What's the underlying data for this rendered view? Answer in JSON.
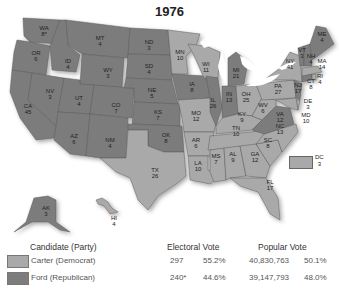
{
  "title": "1976",
  "colors": {
    "democrat": "#a9a9a9",
    "republican": "#7c7c7c",
    "border": "#5a5a5a",
    "water": "#ffffff"
  },
  "states": [
    {
      "abbr": "WA",
      "ev": "8*",
      "party": "R"
    },
    {
      "abbr": "OR",
      "ev": "6",
      "party": "R"
    },
    {
      "abbr": "CA",
      "ev": "45",
      "party": "R"
    },
    {
      "abbr": "ID",
      "ev": "4",
      "party": "R"
    },
    {
      "abbr": "NV",
      "ev": "3",
      "party": "R"
    },
    {
      "abbr": "MT",
      "ev": "4",
      "party": "R"
    },
    {
      "abbr": "WY",
      "ev": "3",
      "party": "R"
    },
    {
      "abbr": "UT",
      "ev": "4",
      "party": "R"
    },
    {
      "abbr": "AZ",
      "ev": "6",
      "party": "R"
    },
    {
      "abbr": "CO",
      "ev": "7",
      "party": "R"
    },
    {
      "abbr": "NM",
      "ev": "4",
      "party": "R"
    },
    {
      "abbr": "ND",
      "ev": "3",
      "party": "R"
    },
    {
      "abbr": "SD",
      "ev": "4",
      "party": "R"
    },
    {
      "abbr": "NE",
      "ev": "5",
      "party": "R"
    },
    {
      "abbr": "KS",
      "ev": "7",
      "party": "R"
    },
    {
      "abbr": "OK",
      "ev": "8",
      "party": "R"
    },
    {
      "abbr": "TX",
      "ev": "26",
      "party": "D"
    },
    {
      "abbr": "MN",
      "ev": "10",
      "party": "D"
    },
    {
      "abbr": "IA",
      "ev": "8",
      "party": "R"
    },
    {
      "abbr": "MO",
      "ev": "12",
      "party": "D"
    },
    {
      "abbr": "AR",
      "ev": "6",
      "party": "D"
    },
    {
      "abbr": "LA",
      "ev": "10",
      "party": "D"
    },
    {
      "abbr": "WI",
      "ev": "11",
      "party": "D"
    },
    {
      "abbr": "IL",
      "ev": "26",
      "party": "R"
    },
    {
      "abbr": "MI",
      "ev": "21",
      "party": "R"
    },
    {
      "abbr": "IN",
      "ev": "13",
      "party": "R"
    },
    {
      "abbr": "OH",
      "ev": "25",
      "party": "D"
    },
    {
      "abbr": "KY",
      "ev": "9",
      "party": "D"
    },
    {
      "abbr": "TN",
      "ev": "10",
      "party": "D"
    },
    {
      "abbr": "MS",
      "ev": "7",
      "party": "D"
    },
    {
      "abbr": "AL",
      "ev": "9",
      "party": "D"
    },
    {
      "abbr": "GA",
      "ev": "12",
      "party": "D"
    },
    {
      "abbr": "FL",
      "ev": "17",
      "party": "D"
    },
    {
      "abbr": "SC",
      "ev": "8",
      "party": "D"
    },
    {
      "abbr": "NC",
      "ev": "13",
      "party": "D"
    },
    {
      "abbr": "VA",
      "ev": "12",
      "party": "R"
    },
    {
      "abbr": "WV",
      "ev": "6",
      "party": "D"
    },
    {
      "abbr": "PA",
      "ev": "27",
      "party": "D"
    },
    {
      "abbr": "NY",
      "ev": "41",
      "party": "D"
    },
    {
      "abbr": "NJ",
      "ev": "17",
      "party": "R"
    },
    {
      "abbr": "DE",
      "ev": "3",
      "party": "D"
    },
    {
      "abbr": "MD",
      "ev": "10",
      "party": "D"
    },
    {
      "abbr": "CT",
      "ev": "8",
      "party": "R"
    },
    {
      "abbr": "RI",
      "ev": "4",
      "party": "D"
    },
    {
      "abbr": "MA",
      "ev": "14",
      "party": "D"
    },
    {
      "abbr": "VT",
      "ev": "3",
      "party": "R"
    },
    {
      "abbr": "NH",
      "ev": "4",
      "party": "R"
    },
    {
      "abbr": "ME",
      "ev": "4",
      "party": "R"
    },
    {
      "abbr": "AK",
      "ev": "3",
      "party": "R"
    },
    {
      "abbr": "HI",
      "ev": "4",
      "party": "D"
    },
    {
      "abbr": "DC",
      "ev": "3",
      "party": "D"
    }
  ],
  "legend": {
    "headers": {
      "candidate": "Candidate (Party)",
      "electoral": "Electoral Vote",
      "popular": "Popular Vote"
    },
    "rows": [
      {
        "candidate": "Carter (Democrat)",
        "ev": "297",
        "ev_pct": "55.2%",
        "pop": "40,830,763",
        "pop_pct": "50.1%"
      },
      {
        "candidate": "Ford (Republican)",
        "ev": "240*",
        "ev_pct": "44.6%",
        "pop": "39,147,793",
        "pop_pct": "48.0%"
      }
    ]
  }
}
